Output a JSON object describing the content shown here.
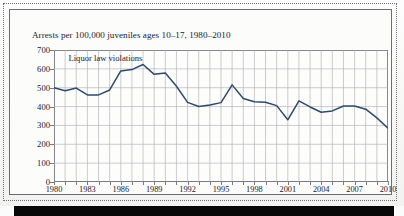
{
  "page": {
    "background_color": "#fbfbfb",
    "border_style": "dotted-scan-border",
    "bottom_bar_color": "#070707"
  },
  "figure": {
    "title": "Arrests per 100,000 juveniles ages 10–17, 1980–2010",
    "series_label": "Liquor law violations",
    "line_color": "#2e4a6b",
    "grid_color": "#a9a9b2",
    "axis_color": "#7a7a82"
  },
  "chart_data": {
    "type": "line",
    "title": "Arrests per 100,000 juveniles ages 10–17, 1980–2010",
    "xlabel": "",
    "ylabel": "",
    "ylim": [
      0,
      700
    ],
    "ytick_step": 100,
    "yticks": [
      0,
      100,
      200,
      300,
      400,
      500,
      600,
      700
    ],
    "ytick_labels": [
      "0",
      "100",
      "200",
      "300",
      "400",
      "500",
      "600",
      "700"
    ],
    "xlim": [
      1980,
      2010
    ],
    "xtick_step": 3,
    "xticks": [
      1980,
      1983,
      1986,
      1989,
      1992,
      1995,
      1998,
      2001,
      2004,
      2007,
      2010
    ],
    "xtick_labels": [
      "1980",
      "1983",
      "1986",
      "1989",
      "1992",
      "1995",
      "1998",
      "2001",
      "2004",
      "2007",
      "2010"
    ],
    "minor_xticks_every": 1,
    "grid": true,
    "grid_axes": "both",
    "legend_position": "inside-top-left",
    "annotations": [
      {
        "text": "Liquor law violations",
        "x": 1981.3,
        "y": 660
      }
    ],
    "x": [
      1980,
      1981,
      1982,
      1983,
      1984,
      1985,
      1986,
      1987,
      1988,
      1989,
      1990,
      1991,
      1992,
      1993,
      1994,
      1995,
      1996,
      1997,
      1998,
      1999,
      2000,
      2001,
      2002,
      2003,
      2004,
      2005,
      2006,
      2007,
      2008,
      2009,
      2010
    ],
    "series": [
      {
        "name": "Liquor law violations",
        "color": "#2e4a6b",
        "values": [
          500,
          484,
          498,
          462,
          462,
          488,
          589,
          596,
          623,
          571,
          578,
          508,
          422,
          400,
          408,
          421,
          515,
          443,
          426,
          423,
          405,
          330,
          430,
          398,
          370,
          377,
          403,
          403,
          386,
          340,
          285
        ]
      }
    ]
  }
}
